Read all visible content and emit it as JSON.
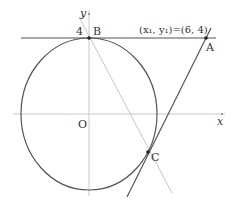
{
  "diagram": {
    "labels": {
      "y_axis": "y",
      "x_axis": "x",
      "origin": "O",
      "tick_4": "4",
      "point_B": "B",
      "point_A": "A",
      "point_C": "C",
      "annotation": "(x₁, y₁)=(6, 4)"
    },
    "colors": {
      "axis": "#c8c8c8",
      "curve": "#555555",
      "tangent": "#555555",
      "gray_line": "#c8c8c8",
      "text": "#333333"
    },
    "elements": [
      "circle centered at origin O with top point B at y=4",
      "horizontal tangent line y=4 through B and A",
      "tangent line through A touching circle at C",
      "gray line through B and C"
    ]
  }
}
